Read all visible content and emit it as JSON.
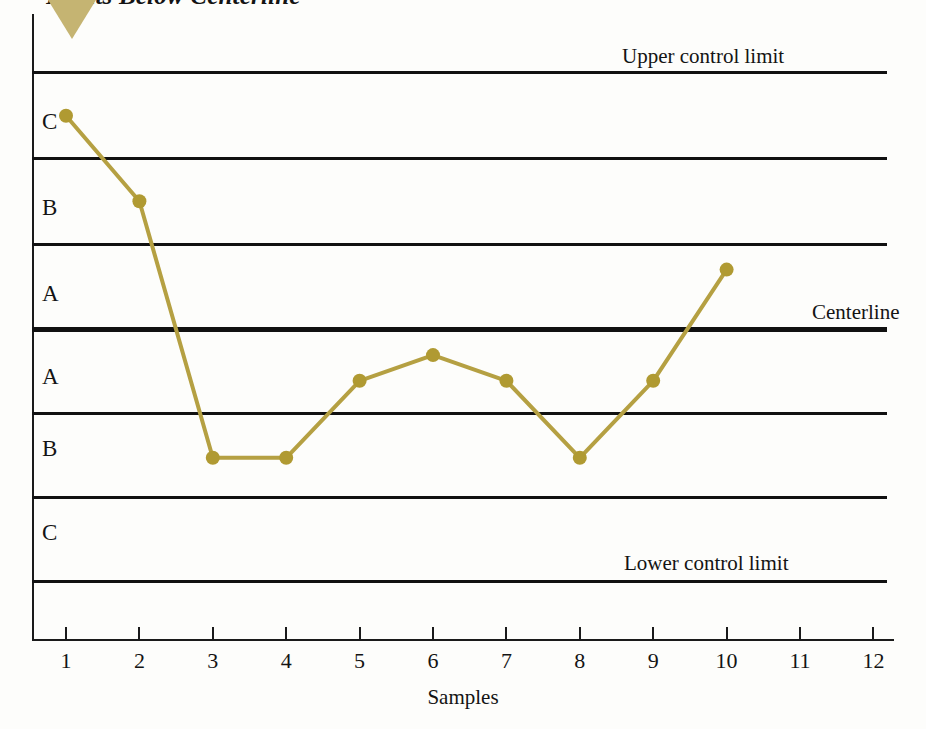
{
  "title": "Points Below Centerline",
  "axes": {
    "x_title": "Samples",
    "x_ticks": [
      "1",
      "2",
      "3",
      "4",
      "5",
      "6",
      "7",
      "8",
      "9",
      "10",
      "11",
      "12"
    ]
  },
  "annotations": {
    "upper_control_limit": "Upper control limit",
    "centerline": "Centerline",
    "lower_control_limit": "Lower control limit"
  },
  "zones": [
    {
      "label": "C",
      "position": "upper-outer"
    },
    {
      "label": "B",
      "position": "upper-middle"
    },
    {
      "label": "A",
      "position": "upper-inner"
    },
    {
      "label": "A",
      "position": "lower-inner"
    },
    {
      "label": "B",
      "position": "lower-middle"
    },
    {
      "label": "C",
      "position": "lower-outer"
    }
  ],
  "colors": {
    "series": "#b5a042",
    "marker": "#b09a32",
    "line": "#111111",
    "pointer": "#c5b472"
  },
  "chart_data": {
    "type": "line",
    "title": "Points Below Centerline",
    "xlabel": "Samples",
    "ylabel": "",
    "x": [
      1,
      2,
      3,
      4,
      5,
      6,
      7,
      8,
      9,
      10
    ],
    "values": [
      2.5,
      1.5,
      -1.5,
      -1.5,
      -0.6,
      -0.3,
      -0.6,
      -1.5,
      -0.6,
      0.7
    ],
    "zone_boundaries": {
      "upper_control_limit": 3,
      "upper_zone_C_B": 2,
      "upper_zone_B_A": 1,
      "centerline": 0,
      "lower_zone_A_B": -1,
      "lower_zone_B_C": -2,
      "lower_control_limit": -3
    },
    "ylim": [
      -3.6,
      3.6
    ],
    "xlim": [
      0.3,
      12.5
    ],
    "grid": false,
    "legend": false,
    "series_name": "Sample measurements",
    "marker": "circle",
    "annotations": [
      "Upper control limit",
      "Centerline",
      "Lower control limit"
    ],
    "zone_labels_top_to_bottom": [
      "C",
      "B",
      "A",
      "A",
      "B",
      "C"
    ],
    "note": "Eight consecutive points (samples 3 through 9 and beyond) fall below the centerline"
  }
}
